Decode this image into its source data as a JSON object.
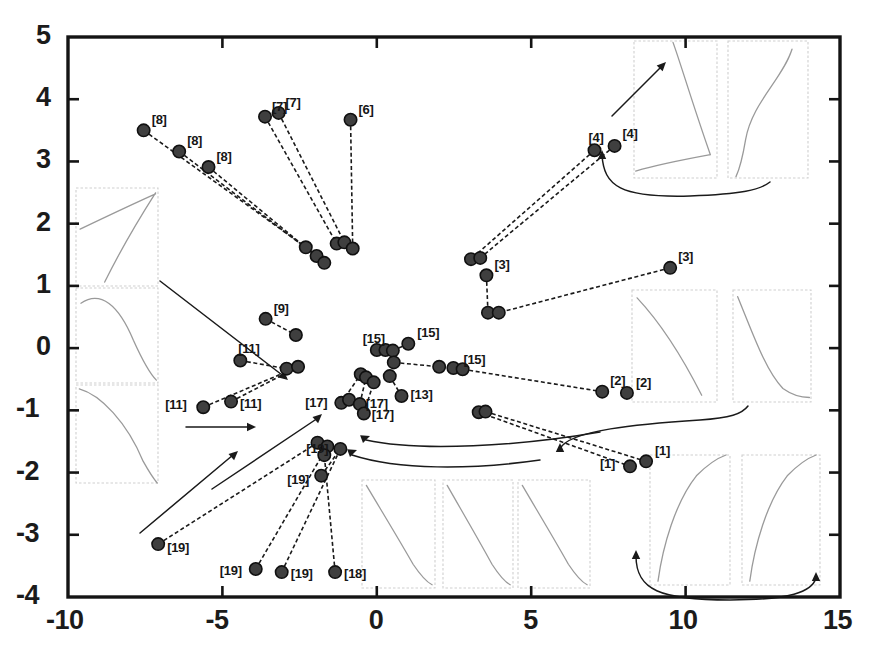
{
  "figure": {
    "background_color": "#ffffff",
    "frame_color": "#141414",
    "point_color": "#3f3f3f",
    "point_edge_color": "#101010",
    "connector_color": "#1a1a1a",
    "inset_border_color": "#cfcfcf",
    "inset_curve_color": "#9a9a9a",
    "annotation_color": "#1a1a1a"
  },
  "chart_data": {
    "type": "scatter",
    "title": "",
    "xlabel": "",
    "ylabel": "",
    "xlim": [
      -10,
      15
    ],
    "ylim": [
      -4,
      5
    ],
    "grid": false,
    "legend": null,
    "xticks": [
      "-10",
      "-5",
      "0",
      "5",
      "10",
      "15"
    ],
    "xtick_values": [
      -10,
      -5,
      0,
      5,
      10,
      15
    ],
    "yticks": [
      "5",
      "4",
      "3",
      "2",
      "1",
      "0",
      "-1",
      "-2",
      "-3",
      "-4"
    ],
    "ytick_values": [
      5,
      4,
      3,
      2,
      1,
      0,
      -1,
      -2,
      -3,
      -4
    ],
    "point_labels": [
      "[1]",
      "[2]",
      "[3]",
      "[4]",
      "[6]",
      "[7]",
      "[8]",
      "[9]",
      "[11]",
      "[13]",
      "[15]",
      "[17]",
      "[18]",
      "[19]"
    ],
    "points": [
      {
        "x": -7.55,
        "y": 3.5,
        "label": "[8]"
      },
      {
        "x": -6.4,
        "y": 3.16,
        "label": "[8]"
      },
      {
        "x": -5.45,
        "y": 2.91,
        "label": "[8]"
      },
      {
        "x": -2.3,
        "y": 1.62,
        "label": ""
      },
      {
        "x": -1.95,
        "y": 1.48,
        "label": ""
      },
      {
        "x": -1.7,
        "y": 1.37,
        "label": ""
      },
      {
        "x": -3.62,
        "y": 3.72,
        "label": "[7]"
      },
      {
        "x": -3.18,
        "y": 3.78,
        "label": "[7]"
      },
      {
        "x": -1.3,
        "y": 1.68,
        "label": ""
      },
      {
        "x": -1.05,
        "y": 1.7,
        "label": ""
      },
      {
        "x": -0.85,
        "y": 3.67,
        "label": "[6]"
      },
      {
        "x": -0.78,
        "y": 1.6,
        "label": ""
      },
      {
        "x": 7.05,
        "y": 3.18,
        "label": "[4]"
      },
      {
        "x": 7.7,
        "y": 3.25,
        "label": "[4]"
      },
      {
        "x": 3.05,
        "y": 1.43,
        "label": ""
      },
      {
        "x": 3.35,
        "y": 1.45,
        "label": ""
      },
      {
        "x": 3.55,
        "y": 1.17,
        "label": "[3]"
      },
      {
        "x": 3.6,
        "y": 0.57,
        "label": ""
      },
      {
        "x": 3.95,
        "y": 0.57,
        "label": ""
      },
      {
        "x": 9.5,
        "y": 1.29,
        "label": "[3]"
      },
      {
        "x": -3.6,
        "y": 0.47,
        "label": "[9]"
      },
      {
        "x": -2.62,
        "y": 0.21,
        "label": ""
      },
      {
        "x": -4.42,
        "y": -0.2,
        "label": "[11]"
      },
      {
        "x": -2.92,
        "y": -0.33,
        "label": ""
      },
      {
        "x": -2.55,
        "y": -0.3,
        "label": ""
      },
      {
        "x": -5.62,
        "y": -0.95,
        "label": "[11]"
      },
      {
        "x": -4.72,
        "y": -0.86,
        "label": "[11]"
      },
      {
        "x": 0.0,
        "y": -0.03,
        "label": ""
      },
      {
        "x": 0.28,
        "y": -0.03,
        "label": ""
      },
      {
        "x": 0.52,
        "y": -0.04,
        "label": "[15]"
      },
      {
        "x": 1.02,
        "y": 0.07,
        "label": "[15]"
      },
      {
        "x": 0.55,
        "y": -0.23,
        "label": ""
      },
      {
        "x": 2.02,
        "y": -0.3,
        "label": ""
      },
      {
        "x": 2.48,
        "y": -0.32,
        "label": "[15]"
      },
      {
        "x": 2.78,
        "y": -0.34,
        "label": ""
      },
      {
        "x": 7.3,
        "y": -0.7,
        "label": "[2]"
      },
      {
        "x": 8.1,
        "y": -0.72,
        "label": "[2]"
      },
      {
        "x": -0.52,
        "y": -0.42,
        "label": ""
      },
      {
        "x": -0.35,
        "y": -0.47,
        "label": ""
      },
      {
        "x": -0.1,
        "y": -0.55,
        "label": ""
      },
      {
        "x": 0.42,
        "y": -0.45,
        "label": ""
      },
      {
        "x": 0.8,
        "y": -0.77,
        "label": "[13]"
      },
      {
        "x": -1.15,
        "y": -0.88,
        "label": "[17]"
      },
      {
        "x": -0.9,
        "y": -0.83,
        "label": ""
      },
      {
        "x": -0.55,
        "y": -0.9,
        "label": "[17]"
      },
      {
        "x": -0.42,
        "y": -1.05,
        "label": "[17]"
      },
      {
        "x": 3.3,
        "y": -1.03,
        "label": ""
      },
      {
        "x": 3.52,
        "y": -1.02,
        "label": ""
      },
      {
        "x": 8.2,
        "y": -1.9,
        "label": "[1]"
      },
      {
        "x": 8.72,
        "y": -1.82,
        "label": "[1]"
      },
      {
        "x": -1.92,
        "y": -1.52,
        "label": ""
      },
      {
        "x": -1.6,
        "y": -1.58,
        "label": ""
      },
      {
        "x": -1.7,
        "y": -1.72,
        "label": ""
      },
      {
        "x": -1.18,
        "y": -1.62,
        "label": "[19]"
      },
      {
        "x": -1.8,
        "y": -2.05,
        "label": "[19]"
      },
      {
        "x": -7.08,
        "y": -3.15,
        "label": "[19]"
      },
      {
        "x": -3.92,
        "y": -3.55,
        "label": "[19]"
      },
      {
        "x": -3.08,
        "y": -3.6,
        "label": "[19]"
      },
      {
        "x": -1.35,
        "y": -3.6,
        "label": "[18]"
      }
    ],
    "connectors": [
      {
        "from": [
          -7.55,
          3.5
        ],
        "to": [
          -2.3,
          1.62
        ]
      },
      {
        "from": [
          -6.4,
          3.16
        ],
        "to": [
          -1.95,
          1.48
        ]
      },
      {
        "from": [
          -5.45,
          2.91
        ],
        "to": [
          -1.7,
          1.37
        ]
      },
      {
        "from": [
          -3.62,
          3.72
        ],
        "to": [
          -1.3,
          1.68
        ]
      },
      {
        "from": [
          -3.18,
          3.78
        ],
        "to": [
          -1.05,
          1.7
        ]
      },
      {
        "from": [
          -0.85,
          3.67
        ],
        "to": [
          -0.78,
          1.6
        ]
      },
      {
        "from": [
          7.05,
          3.18
        ],
        "to": [
          3.05,
          1.43
        ]
      },
      {
        "from": [
          7.7,
          3.25
        ],
        "to": [
          3.35,
          1.45
        ]
      },
      {
        "from": [
          3.55,
          1.17
        ],
        "to": [
          3.6,
          0.57
        ]
      },
      {
        "from": [
          9.5,
          1.29
        ],
        "to": [
          3.95,
          0.57
        ]
      },
      {
        "from": [
          -3.6,
          0.47
        ],
        "to": [
          -2.62,
          0.21
        ]
      },
      {
        "from": [
          -4.42,
          -0.2
        ],
        "to": [
          -2.92,
          -0.33
        ]
      },
      {
        "from": [
          -5.62,
          -0.95
        ],
        "to": [
          -2.55,
          -0.3
        ]
      },
      {
        "from": [
          -4.72,
          -0.86
        ],
        "to": [
          -2.55,
          -0.3
        ]
      },
      {
        "from": [
          1.02,
          0.07
        ],
        "to": [
          0.52,
          -0.04
        ]
      },
      {
        "from": [
          0.55,
          -0.23
        ],
        "to": [
          2.02,
          -0.3
        ]
      },
      {
        "from": [
          2.78,
          -0.34
        ],
        "to": [
          7.3,
          -0.7
        ]
      },
      {
        "from": [
          0.42,
          -0.45
        ],
        "to": [
          0.8,
          -0.77
        ]
      },
      {
        "from": [
          -1.15,
          -0.88
        ],
        "to": [
          -0.52,
          -0.42
        ]
      },
      {
        "from": [
          -0.55,
          -0.9
        ],
        "to": [
          -0.35,
          -0.47
        ]
      },
      {
        "from": [
          -0.42,
          -1.05
        ],
        "to": [
          -0.1,
          -0.55
        ]
      },
      {
        "from": [
          3.3,
          -1.03
        ],
        "to": [
          8.2,
          -1.9
        ]
      },
      {
        "from": [
          3.52,
          -1.02
        ],
        "to": [
          8.72,
          -1.82
        ]
      },
      {
        "from": [
          -7.08,
          -3.15
        ],
        "to": [
          -1.92,
          -1.52
        ]
      },
      {
        "from": [
          -3.92,
          -3.55
        ],
        "to": [
          -1.6,
          -1.58
        ]
      },
      {
        "from": [
          -3.08,
          -3.6
        ],
        "to": [
          -1.18,
          -1.62
        ]
      },
      {
        "from": [
          -1.35,
          -3.6
        ],
        "to": [
          -1.7,
          -1.72
        ]
      },
      {
        "from": [
          -1.8,
          -2.05
        ],
        "to": [
          -1.18,
          -1.62
        ]
      }
    ]
  },
  "insets": [
    {
      "name": "inset-left-top",
      "curve": "rise-concave"
    },
    {
      "name": "inset-left-middle",
      "curve": "hump-fall"
    },
    {
      "name": "inset-left-bottom",
      "curve": "fall-convex"
    },
    {
      "name": "inset-topright-left",
      "curve": "fall-then-flat"
    },
    {
      "name": "inset-topright-right",
      "curve": "s-curve"
    },
    {
      "name": "inset-midright-left",
      "curve": "fall-linear"
    },
    {
      "name": "inset-midright-right",
      "curve": "fall-exponential"
    },
    {
      "name": "inset-bottom-1",
      "curve": "fall-diagonal"
    },
    {
      "name": "inset-bottom-2",
      "curve": "fall-diagonal"
    },
    {
      "name": "inset-bottom-3",
      "curve": "fall-diagonal"
    },
    {
      "name": "inset-bottomright-left",
      "curve": "rise-log"
    },
    {
      "name": "inset-bottomright-right",
      "curve": "rise-log"
    }
  ]
}
